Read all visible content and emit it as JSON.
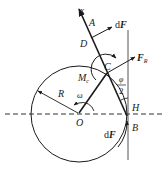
{
  "diagram": {
    "labels": {
      "x_axis": "x",
      "A": "A",
      "D": "D",
      "C": "C",
      "dF_top_d": "d",
      "dF_top_F": "F",
      "FR_F": "F",
      "FR_sub": "R",
      "Mc_M": "M",
      "Mc_sub": "c",
      "phi": "φ",
      "two": "2",
      "H": "H",
      "R": "R",
      "omega": "ω",
      "O": "O",
      "B": "B",
      "dF_bottom_d": "d",
      "dF_bottom_F": "F"
    },
    "colors": {
      "stroke": "#1a1a1a",
      "background": "#ffffff"
    }
  }
}
